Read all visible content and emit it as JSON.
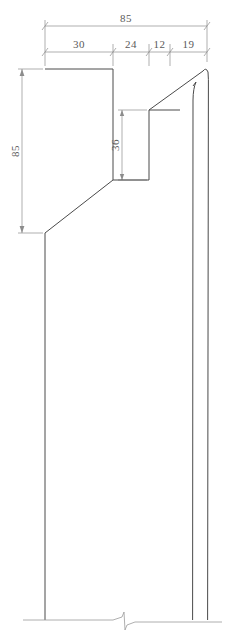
{
  "drawing": {
    "type": "engineering-profile-section",
    "title": "",
    "units_note": "",
    "canvas": {
      "width": 234,
      "height": 639
    },
    "colors": {
      "background": "#ffffff",
      "outline": "#4a4a4a",
      "dimension": "#8c8c8c",
      "dimension_text": "#5a5a5a",
      "break_line": "#9a9a9a"
    },
    "line_weights": {
      "outline": 1.0,
      "dimension": 0.7,
      "extension": 0.7
    }
  },
  "dimensions": {
    "overall_width": {
      "label": "85",
      "orientation": "horizontal",
      "position": "top",
      "value": 85
    },
    "chain_widths": [
      {
        "label": "30",
        "value": 30,
        "orientation": "horizontal"
      },
      {
        "label": "24",
        "value": 24,
        "orientation": "horizontal"
      },
      {
        "label": "12",
        "value": 12,
        "orientation": "horizontal"
      },
      {
        "label": "19",
        "value": 19,
        "orientation": "horizontal"
      }
    ],
    "overall_height": {
      "label": "85",
      "orientation": "vertical",
      "position": "left",
      "value": 85
    },
    "notch_depth": {
      "label": "36",
      "orientation": "vertical",
      "position": "interior",
      "value": 36
    }
  },
  "geometry": {
    "outline_path": "M 45 69 L 113 69 L 113 180 L 149 180 L 149 110 L 193 110 L 207 68",
    "left_body_line": {
      "x": 45,
      "y_top": 233,
      "y_bottom": 620
    },
    "diagonal_chamfer": {
      "x1": 113,
      "y1": 180,
      "x2": 45,
      "y2": 233
    },
    "right_outer_line": {
      "x": 207,
      "y_top": 76,
      "y_bottom": 620
    },
    "right_inner_line": {
      "x": 193,
      "y_top": 88,
      "y_bottom": 620
    },
    "tip_apex": {
      "x": 207,
      "y": 68
    },
    "notch": {
      "x_left": 113,
      "x_right": 149,
      "y_top": 110,
      "y_bottom": 180
    }
  },
  "annotations": {
    "break_symbol": "zigzag-break-line",
    "break_baseline_y": 620
  }
}
